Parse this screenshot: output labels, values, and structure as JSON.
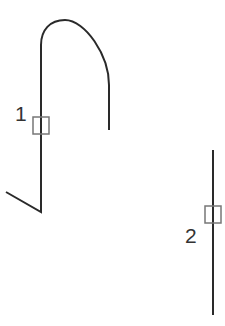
{
  "diagram": {
    "background": "#ffffff",
    "stroke_color": "#2a2a2a",
    "marker_color": "#777777",
    "paths": [
      {
        "id": "path-1",
        "label": "1",
        "d": "M 6 192 L 41 212 L 41 45 C 41 30 50 20 65 20 C 85 20 109 55 109 85 L 109 130",
        "marker": {
          "x": 33,
          "y": 117,
          "w": 16,
          "h": 17
        },
        "label_pos": {
          "x": 15,
          "y": 121
        }
      },
      {
        "id": "path-2",
        "label": "2",
        "d": "M 213 150 L 213 315",
        "marker": {
          "x": 205,
          "y": 206,
          "w": 16,
          "h": 17
        },
        "label_pos": {
          "x": 185,
          "y": 243
        }
      }
    ]
  }
}
